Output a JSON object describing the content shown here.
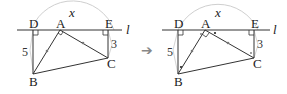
{
  "figure_left": {
    "points": {
      "D": "D",
      "A": "A",
      "E": "E",
      "B": "B",
      "C": "C"
    },
    "line_label": "l",
    "arc_label": "x",
    "lengths": {
      "DB": "5",
      "EC": "3"
    }
  },
  "figure_right": {
    "points": {
      "D": "D",
      "A": "A",
      "E": "E",
      "B": "B",
      "C": "C"
    },
    "line_label": "l",
    "arc_label": "x",
    "lengths": {
      "DB": "5",
      "EC": "3"
    }
  },
  "arrow": "➔",
  "colors": {
    "line": "#333333",
    "circle": "#cccccc",
    "arrow": "#888888"
  }
}
